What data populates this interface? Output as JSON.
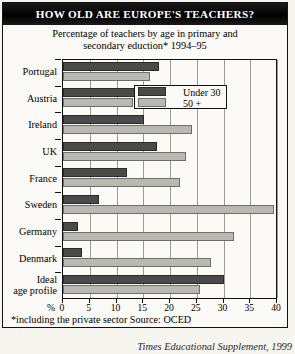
{
  "title": "HOW OLD ARE EUROPE'S TEACHERS?",
  "subtitle_line1": "Percentage of teachers by age in primary and",
  "subtitle_line2": "secondary eduction* 1994–95",
  "legend": {
    "under30_label": "Under 30",
    "over50_label": "50 +",
    "under30_color": "#4a4a4a",
    "over50_color": "#b9b9b4"
  },
  "axis": {
    "percent_sign": "%",
    "ticks": [
      "0",
      "5",
      "10",
      "15",
      "20",
      "25",
      "30",
      "35",
      "40"
    ]
  },
  "footnote": "*including the private sector  Source: OCED",
  "credit": "Times Educational Supplement, 1999",
  "chart_data": {
    "type": "bar",
    "orientation": "horizontal",
    "title": "HOW OLD ARE EUROPE'S TEACHERS?",
    "subtitle": "Percentage of teachers by age in primary and secondary eduction* 1994–95",
    "xlabel": "%",
    "ylabel": "",
    "xlim": [
      0,
      40
    ],
    "xticks": [
      0,
      5,
      10,
      15,
      20,
      25,
      30,
      35,
      40
    ],
    "grid": "vertical",
    "legend_position": "inside-top-right",
    "categories": [
      "Portugal",
      "Austria",
      "Ireland",
      "UK",
      "France",
      "Sweden",
      "Germany",
      "Denmark",
      "Ideal age profile"
    ],
    "series": [
      {
        "name": "Under 30",
        "color": "#4a4a4a",
        "values": [
          18,
          16.3,
          15.2,
          17.6,
          12,
          6.8,
          2.8,
          3.6,
          30
        ]
      },
      {
        "name": "50 +",
        "color": "#b9b9b4",
        "values": [
          16.3,
          13,
          24.2,
          22.9,
          21.8,
          39.5,
          32,
          27.6,
          25.7
        ]
      }
    ],
    "source": "OCED",
    "note": "*including the private sector"
  },
  "rows": [
    {
      "label_line1": "Portugal",
      "label_line2": ""
    },
    {
      "label_line1": "Austria",
      "label_line2": ""
    },
    {
      "label_line1": "Ireland",
      "label_line2": ""
    },
    {
      "label_line1": "UK",
      "label_line2": ""
    },
    {
      "label_line1": "France",
      "label_line2": ""
    },
    {
      "label_line1": "Sweden",
      "label_line2": ""
    },
    {
      "label_line1": "Germany",
      "label_line2": ""
    },
    {
      "label_line1": "Denmark",
      "label_line2": ""
    },
    {
      "label_line1": "Ideal",
      "label_line2": "age profile"
    }
  ]
}
